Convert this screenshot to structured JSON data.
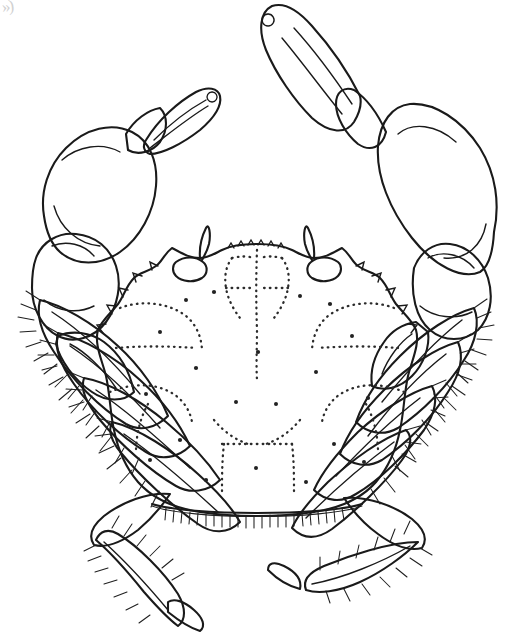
{
  "figure": {
    "kind": "scientific-illustration",
    "view": "dorsal",
    "technique": "pen-and-ink stipple line drawing",
    "width_px": 514,
    "height_px": 641,
    "background_color": "#ffffff",
    "ink_color": "#1a1a1a",
    "stipple_color": "#222222",
    "corner_artifact_text": "»)",
    "caption": ""
  },
  "anatomy": {
    "carapace": {
      "label": "carapace",
      "outline_color": "#1a1a1a",
      "fill": "#ffffff",
      "description": "broad rounded carapace covered in coarse stipple dots with dotted regional grooves"
    },
    "eyes": {
      "label": "eyes",
      "count": 2,
      "color": "#000000"
    },
    "antennae": {
      "label": "antennae",
      "count": 2
    },
    "chelipeds": [
      {
        "label": "left cheliped",
        "side": "left",
        "segments": [
          "dactylus",
          "propodus",
          "carpus",
          "merus"
        ]
      },
      {
        "label": "right cheliped",
        "side": "right",
        "segments": [
          "dactylus",
          "propodus",
          "carpus",
          "merus"
        ]
      }
    ],
    "walking_legs": [
      {
        "label": "left pereiopod 2",
        "side": "left"
      },
      {
        "label": "left pereiopod 3",
        "side": "left"
      },
      {
        "label": "left pereiopod 4",
        "side": "left"
      },
      {
        "label": "left pereiopod 5",
        "side": "left"
      },
      {
        "label": "right pereiopod 2",
        "side": "right"
      },
      {
        "label": "right pereiopod 3",
        "side": "right"
      },
      {
        "label": "right pereiopod 4",
        "side": "right"
      },
      {
        "label": "right pereiopod 5",
        "side": "right"
      }
    ]
  }
}
